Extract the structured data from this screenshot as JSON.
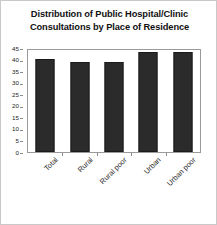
{
  "chart_data": {
    "type": "bar",
    "title": "Distribution of Public Hospital/Clinic Consultations by Place of Residence",
    "title_lines": [
      "Distribution of Public Hospital/Clinic",
      "Consultations by Place of Residence"
    ],
    "categories": [
      "Total",
      "Rural",
      "Rural poor",
      "Urban",
      "Urban poor"
    ],
    "values": [
      41,
      39.5,
      39.5,
      44,
      44
    ],
    "series": [
      {
        "name": "Consultations",
        "values": [
          41,
          39.5,
          39.5,
          44,
          44
        ]
      }
    ],
    "xlabel": "",
    "ylabel": "",
    "ylim": [
      0,
      45
    ],
    "ytick_step": 5,
    "yticks": [
      0,
      5,
      10,
      15,
      20,
      25,
      30,
      35,
      40,
      45
    ],
    "ytick_labels": [
      "0",
      "5",
      "10",
      "15",
      "20",
      "25",
      "30",
      "35",
      "40",
      "45"
    ],
    "grid": false,
    "legend": false,
    "legend_position": "none",
    "bar_color": "#2b2b2b",
    "axis_color": "#9a9a9a",
    "background_color": "#ffffff",
    "border_color": "#c9c9c9",
    "xtick_label_rotation": -45
  }
}
